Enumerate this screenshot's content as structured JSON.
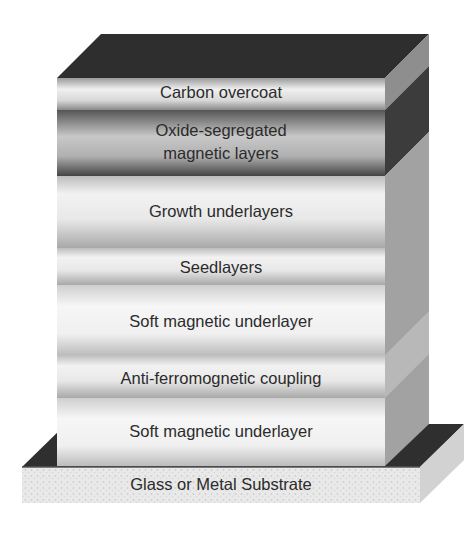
{
  "diagram": {
    "type": "layer-stack",
    "layers": [
      {
        "label": "Carbon overcoat",
        "top": 78,
        "bottom": 110,
        "tone": "light"
      },
      {
        "label": "Oxide-segregated\nmagnetic layers",
        "line1": "Oxide-segregated",
        "line2": "magnetic layers",
        "top": 110,
        "bottom": 176,
        "tone": "dark"
      },
      {
        "label": "Growth underlayers",
        "top": 176,
        "bottom": 248,
        "tone": "light"
      },
      {
        "label": "Seedlayers",
        "top": 248,
        "bottom": 285,
        "tone": "light"
      },
      {
        "label": "Soft magnetic underlayer",
        "top": 285,
        "bottom": 355,
        "tone": "light"
      },
      {
        "label": "Anti-ferromognetic coupling",
        "top": 355,
        "bottom": 398,
        "tone": "light"
      },
      {
        "label": "Soft magnetic underlayer",
        "top": 398,
        "bottom": 466,
        "tone": "light"
      }
    ],
    "substrate": {
      "label": "Glass or Metal Substrate"
    },
    "colors": {
      "top_face": "#2e2e2e",
      "side_face": "#9a9a9a",
      "side_dark": "#3c3c3c",
      "text": "#2b2b2b",
      "substrate": "#e6e6e6"
    }
  }
}
